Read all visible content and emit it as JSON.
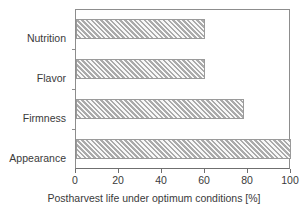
{
  "chart_data": {
    "type": "bar",
    "orientation": "horizontal",
    "title": "",
    "xlabel": "Postharvest life under optimum conditions [%]",
    "ylabel": "",
    "categories": [
      "Appearance",
      "Firmness",
      "Flavor",
      "Nutrition"
    ],
    "values": [
      100,
      78,
      60,
      60
    ],
    "xlim": [
      0,
      100
    ],
    "xticks": [
      0,
      20,
      40,
      60,
      80,
      100
    ],
    "xtick_labels": [
      "0",
      "20",
      "40",
      "60",
      "80",
      "100"
    ],
    "grid": false,
    "legend": false,
    "bar_fill_color": "#cfcfcf",
    "bar_edge_color": "#9a9a9a",
    "bar_pattern": "diagonal-hatch",
    "axis_color": "#6f6f6f",
    "background_color": "#ffffff"
  },
  "axis": {
    "x_title": "Postharvest life under optimum conditions [%]"
  },
  "bars": [
    {
      "label": "Nutrition",
      "value": 60,
      "order": 0
    },
    {
      "label": "Flavor",
      "value": 60,
      "order": 1
    },
    {
      "label": "Firmness",
      "value": 78,
      "order": 2
    },
    {
      "label": "Appearance",
      "value": 100,
      "order": 3
    }
  ],
  "xticks": [
    {
      "value": 0,
      "label": "0"
    },
    {
      "value": 20,
      "label": "20"
    },
    {
      "value": 40,
      "label": "40"
    },
    {
      "value": 60,
      "label": "60"
    },
    {
      "value": 80,
      "label": "80"
    },
    {
      "value": 100,
      "label": "100"
    }
  ]
}
